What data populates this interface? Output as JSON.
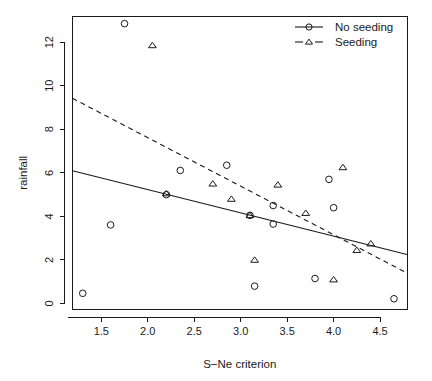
{
  "chart_data": {
    "type": "scatter",
    "title": "",
    "xlabel": "S−Ne criterion",
    "ylabel": "rainfall",
    "xlim": [
      1.19,
      4.79
    ],
    "ylim": [
      -0.25,
      13.2
    ],
    "xticks": [
      "1.5",
      "2.0",
      "2.5",
      "3.0",
      "3.5",
      "4.0",
      "4.5"
    ],
    "xtick_values": [
      1.5,
      2.0,
      2.5,
      3.0,
      3.5,
      4.0,
      4.5
    ],
    "yticks": [
      "0",
      "2",
      "4",
      "6",
      "8",
      "10",
      "12"
    ],
    "ytick_values": [
      0,
      2,
      4,
      6,
      8,
      10,
      12
    ],
    "grid": false,
    "legend_position": "top-right",
    "series": [
      {
        "name": "No seeding",
        "marker": "circle",
        "line_style": "solid",
        "color": "#1a1a1a",
        "points": [
          {
            "x": 1.75,
            "y": 12.85
          },
          {
            "x": 1.3,
            "y": 0.47
          },
          {
            "x": 1.6,
            "y": 3.61
          },
          {
            "x": 2.35,
            "y": 6.11
          },
          {
            "x": 2.2,
            "y": 5.0
          },
          {
            "x": 2.85,
            "y": 6.35
          },
          {
            "x": 3.1,
            "y": 4.05
          },
          {
            "x": 3.15,
            "y": 0.8
          },
          {
            "x": 3.35,
            "y": 4.5
          },
          {
            "x": 3.35,
            "y": 3.65
          },
          {
            "x": 3.8,
            "y": 1.15
          },
          {
            "x": 3.95,
            "y": 5.7
          },
          {
            "x": 4.0,
            "y": 4.4
          },
          {
            "x": 4.65,
            "y": 0.22
          }
        ],
        "fit_line": {
          "x_start": 1.19,
          "y_start": 6.1,
          "x_end": 4.79,
          "y_end": 2.25
        }
      },
      {
        "name": "Seeding",
        "marker": "triangle",
        "line_style": "dashed",
        "color": "#1a1a1a",
        "points": [
          {
            "x": 2.05,
            "y": 11.85
          },
          {
            "x": 2.2,
            "y": 5.05
          },
          {
            "x": 2.7,
            "y": 5.5
          },
          {
            "x": 2.9,
            "y": 4.8
          },
          {
            "x": 3.1,
            "y": 4.05
          },
          {
            "x": 3.15,
            "y": 2.0
          },
          {
            "x": 3.4,
            "y": 5.45
          },
          {
            "x": 3.7,
            "y": 4.15
          },
          {
            "x": 4.1,
            "y": 6.25
          },
          {
            "x": 4.0,
            "y": 1.1
          },
          {
            "x": 4.25,
            "y": 2.45
          },
          {
            "x": 4.4,
            "y": 2.75
          }
        ],
        "fit_line": {
          "x_start": 1.19,
          "y_start": 9.42,
          "x_end": 4.79,
          "y_end": 1.4
        }
      }
    ],
    "legend": [
      {
        "label": "No seeding",
        "marker": "circle",
        "line_style": "solid"
      },
      {
        "label": "Seeding",
        "marker": "triangle",
        "line_style": "dashed"
      }
    ]
  }
}
